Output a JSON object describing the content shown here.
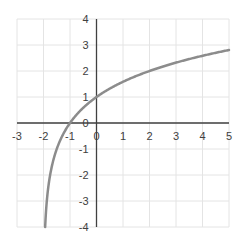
{
  "chart_data": {
    "type": "line",
    "title": "",
    "xlabel": "",
    "ylabel": "",
    "function": "y = log2(x + 2)",
    "xlim": [
      -3,
      5
    ],
    "ylim": [
      -4,
      4
    ],
    "grid": true,
    "legend": null,
    "x_ticks": [
      "-3",
      "-2",
      "-1",
      "0",
      "1",
      "2",
      "3",
      "4",
      "5"
    ],
    "y_ticks": [
      "4",
      "3",
      "2",
      "1",
      "0",
      "-1",
      "-2",
      "-3",
      "-4"
    ],
    "series": [
      {
        "name": "curve",
        "color": "#8c8c8c",
        "x": [
          -1.9375,
          -1.875,
          -1.75,
          -1.5,
          -1,
          0,
          1,
          2,
          3,
          4,
          5
        ],
        "y": [
          -4,
          -3,
          -2,
          -1,
          0,
          1,
          1.585,
          2,
          2.322,
          2.585,
          2.807
        ]
      }
    ]
  },
  "colors": {
    "axis": "#404040",
    "grid": "#e4e4e4",
    "curve": "#8c8c8c",
    "label": "#404040"
  }
}
